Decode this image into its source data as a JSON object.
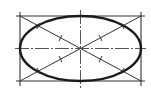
{
  "diagram": {
    "title": "",
    "type": "ellipse-construction",
    "colors": {
      "background": "#ffffff",
      "stroke": "#1a1a1a",
      "thin_stroke": "#333333"
    },
    "rectangle": {
      "x1": 20,
      "y1": 16,
      "x2": 141,
      "y2": 81
    },
    "ellipse": {
      "cx": 80.5,
      "cy": 48.5,
      "rx": 60.5,
      "ry": 32.5
    },
    "center_lines": {
      "horizontal": {
        "x1": 15,
        "x2": 146,
        "y": 48.5
      },
      "vertical": {
        "y1": 10,
        "y2": 89,
        "x": 80.5
      }
    },
    "labels": []
  }
}
